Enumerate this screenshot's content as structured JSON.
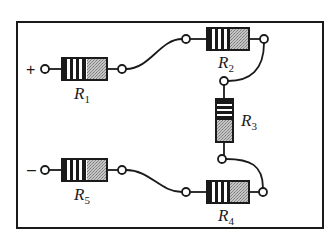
{
  "diagram": {
    "type": "series resistor circuit",
    "colors": {
      "line": "#1a1a1a",
      "body_fill": "#b8b8b8",
      "background": "#ffffff"
    },
    "terminals": {
      "positive": "+",
      "negative": "–"
    },
    "resistors": [
      {
        "id": "R1",
        "letter": "R",
        "subscript": "1"
      },
      {
        "id": "R2",
        "letter": "R",
        "subscript": "2"
      },
      {
        "id": "R3",
        "letter": "R",
        "subscript": "3"
      },
      {
        "id": "R4",
        "letter": "R",
        "subscript": "4"
      },
      {
        "id": "R5",
        "letter": "R",
        "subscript": "5"
      }
    ],
    "connections": [
      "+ → R1",
      "R1 → R2",
      "R2 → R3",
      "R3 → R4",
      "R4 → R5",
      "R5 → –"
    ]
  }
}
